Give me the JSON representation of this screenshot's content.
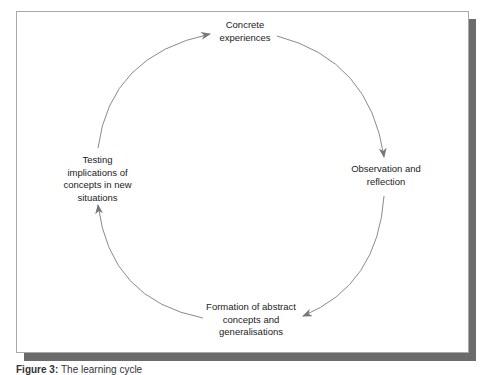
{
  "diagram": {
    "type": "cycle",
    "nodes": [
      {
        "id": "concrete",
        "lines": [
          "Concrete",
          "experiences"
        ]
      },
      {
        "id": "observation",
        "lines": [
          "Observation and",
          "reflection"
        ]
      },
      {
        "id": "formation",
        "lines": [
          "Formation of abstract",
          "concepts and",
          "generalisations"
        ]
      },
      {
        "id": "testing",
        "lines": [
          "Testing",
          "implications of",
          "concepts in new",
          "situations"
        ]
      }
    ],
    "edges": [
      {
        "from": "concrete",
        "to": "observation"
      },
      {
        "from": "observation",
        "to": "formation"
      },
      {
        "from": "formation",
        "to": "testing"
      },
      {
        "from": "testing",
        "to": "concrete"
      }
    ]
  },
  "caption": {
    "label": "Figure 3:",
    "text": "The learning cycle"
  },
  "colors": {
    "arc": "#8a8a8a",
    "frame_border": "#a8a8a8",
    "shadow": "#6b6b6b"
  }
}
